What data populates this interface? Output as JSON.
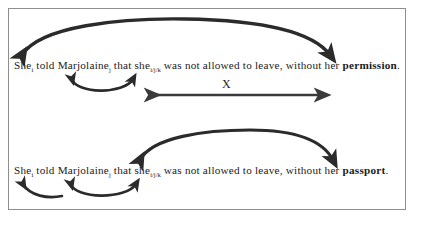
{
  "figure": {
    "background_color": "#ffffff",
    "frame_color": "#8e8e8e",
    "ink_color": "#2b2b2b",
    "text_color": "#1b1b1b"
  },
  "examples": [
    {
      "id": "example-1",
      "segments": [
        {
          "text": "She",
          "sub": "i",
          "bold": false
        },
        {
          "text": " told Marjolaine",
          "sub": "j",
          "bold": false
        },
        {
          "text": " that she",
          "sub": "i/j/k",
          "bold": false
        },
        {
          "text": " was not allowed to leave, without her ",
          "sub": "",
          "bold": false
        },
        {
          "text": "permission",
          "sub": "",
          "bold": true
        },
        {
          "text": ".",
          "sub": "",
          "bold": false
        }
      ],
      "plain_text": "Shei told Marjolainej that shei/j/k was not allowed to leave, without her permission."
    },
    {
      "id": "example-2",
      "segments": [
        {
          "text": "She",
          "sub": "i",
          "bold": false
        },
        {
          "text": " told Marjolaine",
          "sub": "j",
          "bold": false
        },
        {
          "text": " that she",
          "sub": "i/j/k",
          "bold": false
        },
        {
          "text": " was not allowed  to leave, without her ",
          "sub": "",
          "bold": false
        },
        {
          "text": "passport",
          "sub": "",
          "bold": true
        },
        {
          "text": ".",
          "sub": "",
          "bold": false
        }
      ],
      "plain_text": "Shei told Marjolainej that shei/j/k was not allowed  to leave, without her passport."
    }
  ],
  "annotations": {
    "measure_arrow_label": "X",
    "arcs": [
      {
        "name": "arc-she-permission",
        "example": 1,
        "position": "above",
        "span": "She → permission"
      },
      {
        "name": "arc-marjolaine-she",
        "example": 1,
        "position": "below",
        "span": "Marjolaine ↔ she"
      },
      {
        "name": "arc-she-passport",
        "example": 2,
        "position": "above",
        "span": "she → passport"
      },
      {
        "name": "arc-she-marjolaine-low",
        "example": 2,
        "position": "below",
        "span": "She ↔ Marjolaine"
      },
      {
        "name": "arc-marjolaine-she-low",
        "example": 2,
        "position": "below",
        "span": "Marjolaine ↔ she"
      }
    ]
  }
}
